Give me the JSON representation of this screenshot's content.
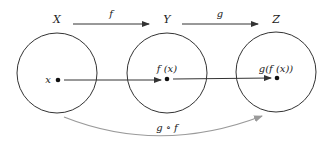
{
  "sets": [
    {
      "label": "X",
      "element": "x"
    },
    {
      "label": "Y",
      "element": "f (x)"
    },
    {
      "label": "Z",
      "element": "g(f (x))"
    }
  ],
  "top_arrows": [
    {
      "label": "f"
    },
    {
      "label": "g"
    }
  ],
  "composition": {
    "label": "g ∘ f",
    "color": "#9a9a9a"
  },
  "colors": {
    "stroke": "#333333",
    "curve": "#9a9a9a"
  }
}
